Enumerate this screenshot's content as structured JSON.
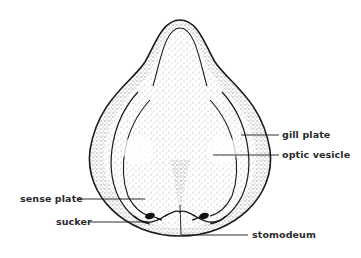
{
  "figure": {
    "labels": {
      "gill_plate": "gill plate",
      "optic_vesicle": "optic vesicle",
      "sense_plate": "sense plate",
      "sucker": "sucker",
      "stomodeum": "stomodeum"
    },
    "colors": {
      "background": "#ffffff",
      "outline": "#1a1a1a",
      "stipple": "#555555",
      "label_text": "#2a2a2a"
    }
  }
}
